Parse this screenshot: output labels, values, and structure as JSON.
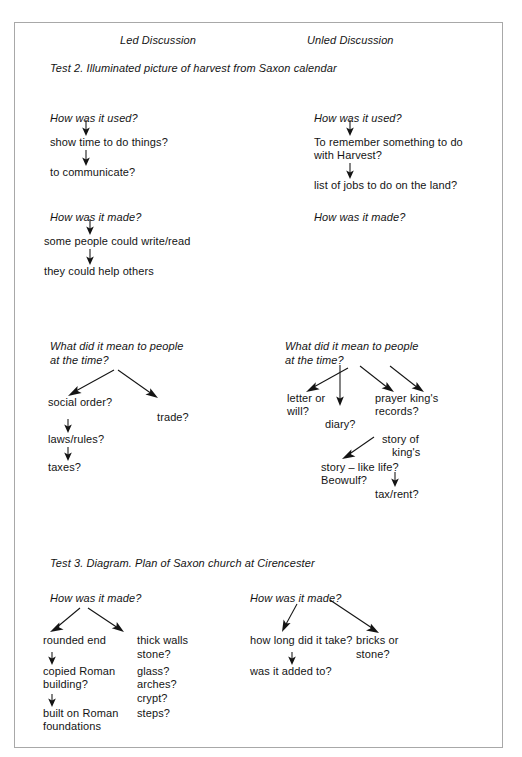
{
  "page": {
    "border_color": "#a8a8a8",
    "background": "#ffffff"
  },
  "headers": {
    "left": "Led Discussion",
    "right": "Unled Discussion"
  },
  "sections": [
    {
      "id": "test-2",
      "title": "Test 2. Illuminated picture of harvest from Saxon calendar",
      "columns": {
        "left": {
          "groups": [
            {
              "prompt": "How was it used?",
              "responses": [
                "show time to do things?",
                "to communicate?"
              ]
            },
            {
              "prompt": "How was it made?",
              "responses": [
                "some people could write/read",
                "they could help others"
              ]
            },
            {
              "prompt_line1": "What did it mean to people",
              "prompt_line2": "at the time?",
              "responses": [
                "social order?",
                "laws/rules?",
                "taxes?",
                "trade?"
              ]
            }
          ]
        },
        "right": {
          "groups": [
            {
              "prompt": "How was it used?",
              "responses": [
                "To remember something to do",
                "with Harvest?",
                "list of jobs to do on the land?"
              ]
            },
            {
              "prompt": "How was it made?",
              "responses": []
            },
            {
              "prompt_line1": "What did it mean to people",
              "prompt_line2": "at the time?",
              "responses": [
                "letter or",
                "will?",
                "diary?",
                "prayer king's",
                "records?",
                "story of",
                "king's",
                "story – like life?",
                "Beowulf?",
                "tax/rent?"
              ]
            }
          ]
        }
      }
    },
    {
      "id": "test-3",
      "title": "Test 3. Diagram. Plan of Saxon church at Cirencester",
      "columns": {
        "left": {
          "groups": [
            {
              "prompt": "How was it made?",
              "responses": [
                "rounded end",
                "copied Roman",
                "building?",
                "built on Roman",
                "foundations",
                "thick walls",
                "stone?",
                "glass?",
                "arches?",
                "crypt?",
                "steps?"
              ]
            }
          ]
        },
        "right": {
          "groups": [
            {
              "prompt": "How was it made?",
              "responses": [
                "how long did it take?",
                "was it added to?",
                "bricks or",
                "stone?"
              ]
            }
          ]
        }
      }
    }
  ],
  "text": {
    "hdr_left": "Led Discussion",
    "hdr_right": "Unled Discussion",
    "t2_title": "Test 2. Illuminated picture of harvest from Saxon calendar",
    "t3_title": "Test 3. Diagram. Plan of Saxon church at Cirencester",
    "l_used_q": "How was it used?",
    "l_used_a1": "show time to do things?",
    "l_used_a2": "to communicate?",
    "l_made_q": "How was it made?",
    "l_made_a1": "some people could write/read",
    "l_made_a2": "they could help others",
    "l_mean_q1": "What did it mean to people",
    "l_mean_q2": "at the time?",
    "l_mean_a1": "social order?",
    "l_mean_a2": "laws/rules?",
    "l_mean_a3": "taxes?",
    "l_mean_a4": "trade?",
    "r_used_q": "How was it used?",
    "r_used_a1": "To remember something to do",
    "r_used_a1b": "with Harvest?",
    "r_used_a2": "list of jobs to do on the land?",
    "r_made_q": "How was it made?",
    "r_mean_q1": "What did it mean to people",
    "r_mean_q2": "at the time?",
    "r_mean_a1": "letter or",
    "r_mean_a1b": "will?",
    "r_mean_a2": "diary?",
    "r_mean_a3": "prayer king's",
    "r_mean_a3b": "records?",
    "r_mean_a4": "story of",
    "r_mean_a4b": "king's",
    "r_mean_a5": "story – like life?",
    "r_mean_a5b": "Beowulf?",
    "r_mean_a6": "tax/rent?",
    "t3_l_q": "How was it made?",
    "t3_l_a1": "rounded end",
    "t3_l_a2": "copied Roman",
    "t3_l_a2b": "building?",
    "t3_l_a3": "built on Roman",
    "t3_l_a3b": "foundations",
    "t3_l_b1": "thick walls",
    "t3_l_b2": "stone?",
    "t3_l_b3": "glass?",
    "t3_l_b4": "arches?",
    "t3_l_b5": "crypt?",
    "t3_l_b6": "steps?",
    "t3_r_q": "How was it made?",
    "t3_r_a1": "how long did it take?",
    "t3_r_a2": "was it added to?",
    "t3_r_b1": "bricks or",
    "t3_r_b2": "stone?"
  }
}
